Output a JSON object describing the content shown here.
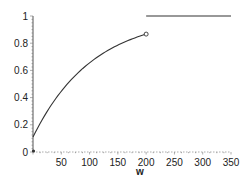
{
  "chart_data": {
    "type": "line",
    "title": "",
    "xlabel": "w",
    "ylabel": "",
    "xlim": [
      0,
      350
    ],
    "ylim": [
      0,
      1
    ],
    "x_ticks": [
      50,
      100,
      150,
      200,
      250,
      300,
      350
    ],
    "y_ticks": [
      0,
      0.2,
      0.4,
      0.6,
      0.8,
      1
    ],
    "y_tick_labels": [
      "0",
      "0.2",
      "0.4",
      "0.6",
      "0.8",
      "1"
    ],
    "x_tick_labels": [
      "50",
      "100",
      "150",
      "200",
      "250",
      "300",
      "350"
    ],
    "grid": false,
    "legend": null,
    "series": [
      {
        "name": "piecewise segment 1 (curve)",
        "x": [
          0,
          25,
          50,
          75,
          100,
          125,
          150,
          175,
          200
        ],
        "y": [
          0.11,
          0.27,
          0.41,
          0.53,
          0.63,
          0.71,
          0.78,
          0.83,
          0.87
        ],
        "end_marker": "open-circle"
      },
      {
        "name": "piecewise segment 2 (constant)",
        "x": [
          200,
          350
        ],
        "y": [
          1,
          1
        ]
      }
    ],
    "annotations": [
      "open circle at w=200, y≈0.87",
      "small dot at origin (0,0)"
    ]
  }
}
